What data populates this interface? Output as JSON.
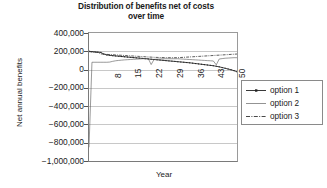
{
  "chart_data": {
    "type": "line",
    "title": "Distribution of benefits net of costs over time",
    "title_line1": "Distribution of benefits net of costs",
    "title_line2": "over time",
    "xlabel": "Year",
    "ylabel": "Net annual benefits",
    "ylim": [
      -1000000,
      400000
    ],
    "ytick_step": 200000,
    "ytick_labels": [
      "400,000",
      "200,000",
      "0",
      "−200,000",
      "−400,000",
      "−600,000",
      "−800,000",
      "−1,000,000"
    ],
    "ytick_values": [
      400000,
      200000,
      0,
      -200000,
      -400000,
      -600000,
      -800000,
      -1000000
    ],
    "xlim": [
      1,
      51
    ],
    "xtick_labels": [
      "8",
      "15",
      "22",
      "29",
      "36",
      "43",
      "50"
    ],
    "xtick_values": [
      8,
      15,
      22,
      29,
      36,
      43,
      50
    ],
    "grid": "horizontal",
    "legend_position": "right",
    "x": [
      1,
      2,
      3,
      4,
      5,
      6,
      7,
      8,
      9,
      10,
      11,
      12,
      13,
      14,
      15,
      16,
      17,
      18,
      19,
      20,
      21,
      22,
      23,
      24,
      25,
      26,
      27,
      28,
      29,
      30,
      31,
      32,
      33,
      34,
      35,
      36,
      37,
      38,
      39,
      40,
      41,
      42,
      43,
      44,
      45,
      46,
      47,
      48,
      49,
      50,
      51
    ],
    "series": [
      {
        "name": "option 1",
        "style": "solid-marker",
        "color": "#222222",
        "values": [
          200000,
          196000,
          193000,
          190000,
          187000,
          170000,
          160000,
          156000,
          152000,
          149000,
          146000,
          143000,
          140000,
          137000,
          134000,
          131000,
          128000,
          125000,
          122000,
          119000,
          116000,
          113000,
          110000,
          107000,
          104000,
          101000,
          98000,
          95000,
          92000,
          89000,
          86000,
          83000,
          80000,
          77000,
          74000,
          70000,
          66000,
          62000,
          58000,
          54000,
          50000,
          46000,
          42000,
          36000,
          30000,
          22000,
          14000,
          6000,
          -2000,
          -12000,
          -24000
        ]
      },
      {
        "name": "option 2",
        "style": "solid-thin",
        "color": "#555555",
        "values": [
          -850000,
          80000,
          80000,
          80000,
          80000,
          80000,
          80000,
          82000,
          90000,
          96000,
          100000,
          103000,
          106000,
          108000,
          110000,
          112000,
          114000,
          116000,
          118000,
          120000,
          122000,
          55000,
          112000,
          114000,
          116000,
          118000,
          118000,
          118000,
          118000,
          118000,
          118000,
          116000,
          114000,
          112000,
          110000,
          108000,
          106000,
          104000,
          102000,
          100000,
          98000,
          96000,
          94000,
          52000,
          116000,
          120000,
          124000,
          126000,
          128000,
          130000,
          130000
        ]
      },
      {
        "name": "option 3",
        "style": "dash-dot",
        "color": "#333333",
        "values": [
          196000,
          193000,
          190000,
          188000,
          172000,
          168000,
          166000,
          164000,
          162000,
          160000,
          158000,
          156000,
          154000,
          152000,
          150000,
          148000,
          146000,
          144000,
          142000,
          140000,
          138000,
          136000,
          134000,
          133000,
          132000,
          131000,
          130000,
          130000,
          130000,
          130000,
          130000,
          132000,
          134000,
          136000,
          138000,
          140000,
          142000,
          144000,
          146000,
          148000,
          150000,
          152000,
          154000,
          156000,
          158000,
          160000,
          162000,
          164000,
          166000,
          168000,
          170000
        ]
      }
    ]
  },
  "legend": {
    "items": [
      {
        "label": "option 1"
      },
      {
        "label": "option 2"
      },
      {
        "label": "option 3"
      }
    ]
  }
}
